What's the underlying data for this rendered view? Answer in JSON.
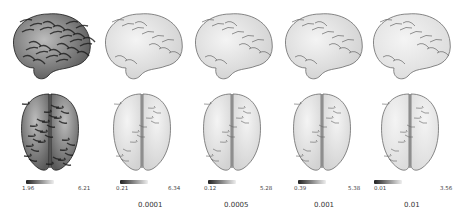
{
  "figure": {
    "panels": [
      {
        "id": "p1",
        "shading": "dark",
        "colorbar": {
          "min": "1.96",
          "max": "6.21"
        },
        "caption": ""
      },
      {
        "id": "p2",
        "shading": "light",
        "colorbar": {
          "min": "0.21",
          "max": "6.34"
        },
        "caption": "0.0001"
      },
      {
        "id": "p3",
        "shading": "light",
        "colorbar": {
          "min": "0.12",
          "max": "5.28"
        },
        "caption": "0.0005"
      },
      {
        "id": "p4",
        "shading": "light",
        "colorbar": {
          "min": "0.39",
          "max": "5.38"
        },
        "caption": "0.001"
      },
      {
        "id": "p5",
        "shading": "lightest",
        "colorbar": {
          "min": "0.01",
          "max": "3.56"
        },
        "caption": "0.01"
      }
    ],
    "colorbar_colors": {
      "start": "#222222",
      "end": "#eeeeee"
    }
  }
}
